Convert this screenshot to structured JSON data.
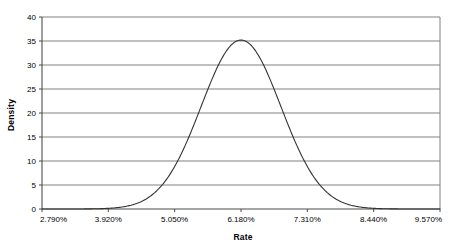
{
  "chart_data": {
    "type": "line",
    "title": "",
    "subtitle": "",
    "xlabel": "Rate",
    "ylabel": "Density",
    "xlim": [
      2.79,
      9.57
    ],
    "ylim": [
      0,
      40
    ],
    "grid": "horizontal",
    "legend": "none",
    "x_tick_labels": [
      "2.790%",
      "3.920%",
      "5.050%",
      "6.180%",
      "7.310%",
      "8.440%",
      "9.570%"
    ],
    "x_tick_values": [
      2.79,
      3.92,
      5.05,
      6.18,
      7.31,
      8.44,
      9.57
    ],
    "y_tick_labels": [
      "0",
      "5",
      "10",
      "15",
      "20",
      "25",
      "30",
      "35",
      "40"
    ],
    "y_tick_values": [
      0,
      5,
      10,
      15,
      20,
      25,
      30,
      35,
      40
    ],
    "distribution": {
      "name": "normal",
      "mean": 6.18,
      "sigma": 0.68,
      "peak_density": 35.2
    },
    "series": [
      {
        "name": "Density",
        "color": "#333333",
        "x": [
          2.79,
          3.02,
          3.24,
          3.47,
          3.69,
          3.92,
          4.14,
          4.37,
          4.59,
          4.82,
          5.05,
          5.27,
          5.5,
          5.72,
          5.95,
          6.18,
          6.4,
          6.63,
          6.85,
          7.08,
          7.31,
          7.53,
          7.76,
          7.98,
          8.21,
          8.44,
          8.66,
          8.89,
          9.11,
          9.34,
          9.57
        ],
        "values": [
          0.0,
          0.01,
          0.04,
          0.15,
          0.48,
          1.32,
          3.1,
          6.3,
          11.0,
          16.7,
          22.9,
          28.4,
          32.5,
          34.8,
          35.2,
          35.2,
          34.8,
          32.5,
          28.4,
          22.9,
          16.7,
          11.0,
          6.3,
          3.1,
          1.32,
          0.48,
          0.15,
          0.04,
          0.01,
          0.0,
          0.0
        ]
      }
    ]
  },
  "style": {
    "gridline_color": "#808080",
    "axis_color": "#4d4d4d",
    "curve_color": "#333333",
    "plot_background": "#ffffff",
    "text_color": "#000000"
  }
}
